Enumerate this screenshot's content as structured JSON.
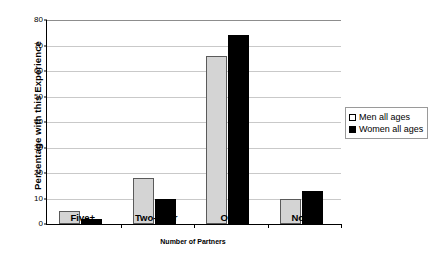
{
  "chart_data": {
    "type": "bar",
    "title": "",
    "xlabel": "Number of Partners",
    "ylabel": "Percentage with this Experience",
    "categories": [
      "Five+",
      "Two-Four",
      "One",
      "None"
    ],
    "series": [
      {
        "name": "Men all ages",
        "color": "#d4d4d4",
        "values": [
          5,
          18,
          66,
          10
        ]
      },
      {
        "name": "Women all ages",
        "color": "#000000",
        "values": [
          2,
          10,
          74,
          13
        ]
      }
    ],
    "ylim": [
      0,
      80
    ],
    "ytick_step": 10,
    "yticks": [
      0,
      10,
      20,
      30,
      40,
      50,
      60,
      70,
      80
    ],
    "ytick_labels": [
      "0",
      "10",
      "20",
      "30",
      "40",
      "50",
      "60",
      "70",
      "80"
    ],
    "grid": true,
    "legend_position": "right",
    "legend": [
      "Men all ages",
      "Women all ages"
    ]
  }
}
